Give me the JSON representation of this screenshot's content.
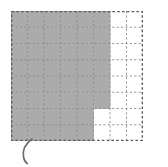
{
  "figure": {
    "grid": {
      "columns": 8,
      "rows": 8,
      "cell_width": 16.5,
      "cell_height": 16.25,
      "border_style": "dashed",
      "gridline_style": "dashed",
      "border_color": "#5a5a5a",
      "gridline_color": "#8c8c8c",
      "background_color": "#ffffff"
    },
    "shading": {
      "fill_color": "#ababab",
      "unshaded_color": "#ffffff",
      "description": "stepped shaded region covering left portion of grid",
      "shaded_cells_per_row": [
        6,
        6,
        6,
        6,
        6,
        6,
        5,
        5
      ],
      "total_cells": 64,
      "shaded_cells": 46
    }
  },
  "chart_data": {
    "type": "heatmap",
    "xlabel": "",
    "ylabel": "",
    "categories": [
      "1",
      "2",
      "3",
      "4",
      "5",
      "6",
      "7",
      "8"
    ],
    "x": [
      "1",
      "2",
      "3",
      "4",
      "5",
      "6",
      "7",
      "8"
    ],
    "values": [
      [
        1,
        1,
        1,
        1,
        1,
        1,
        0,
        0
      ],
      [
        1,
        1,
        1,
        1,
        1,
        1,
        0,
        0
      ],
      [
        1,
        1,
        1,
        1,
        1,
        1,
        0,
        0
      ],
      [
        1,
        1,
        1,
        1,
        1,
        1,
        0,
        0
      ],
      [
        1,
        1,
        1,
        1,
        1,
        1,
        0,
        0
      ],
      [
        1,
        1,
        1,
        1,
        1,
        1,
        0,
        0
      ],
      [
        1,
        1,
        1,
        1,
        1,
        0,
        0,
        0
      ],
      [
        1,
        1,
        1,
        1,
        1,
        0,
        0,
        0
      ]
    ],
    "legend": [],
    "grid": true,
    "ylim": [
      0,
      8
    ],
    "xlim": [
      0,
      8
    ]
  },
  "annotations": {
    "paren": {
      "text": "(",
      "kind": "handwritten-open-parenthesis",
      "color": "#6b6b6b"
    }
  }
}
